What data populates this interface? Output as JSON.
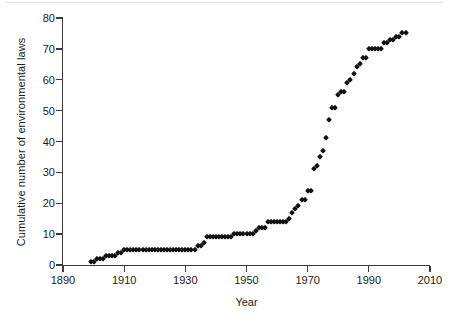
{
  "figure": {
    "background_color": "#ffffff",
    "marker_color": "#111111",
    "axis_color": "#3a3a3a"
  },
  "chart_data": {
    "type": "scatter",
    "title": "",
    "xlabel": "Year",
    "ylabel": "Cumulative number of environmental laws",
    "xlim": [
      1890,
      2010
    ],
    "ylim": [
      0,
      80
    ],
    "xticks": [
      1890,
      1910,
      1930,
      1950,
      1970,
      1990,
      2010
    ],
    "yticks": [
      0,
      10,
      20,
      30,
      40,
      50,
      60,
      70,
      80
    ],
    "grid": false,
    "legend": null,
    "marker": "diamond",
    "series": [
      {
        "name": "Cumulative environmental laws",
        "x": [
          1899,
          1900,
          1901,
          1902,
          1903,
          1904,
          1905,
          1906,
          1907,
          1908,
          1909,
          1910,
          1911,
          1912,
          1913,
          1914,
          1915,
          1916,
          1917,
          1918,
          1919,
          1920,
          1921,
          1922,
          1923,
          1924,
          1925,
          1926,
          1927,
          1928,
          1929,
          1930,
          1931,
          1932,
          1933,
          1934,
          1935,
          1936,
          1937,
          1938,
          1939,
          1940,
          1941,
          1942,
          1943,
          1944,
          1945,
          1946,
          1947,
          1948,
          1949,
          1950,
          1951,
          1952,
          1953,
          1954,
          1955,
          1956,
          1957,
          1958,
          1959,
          1960,
          1961,
          1962,
          1963,
          1964,
          1965,
          1966,
          1967,
          1968,
          1969,
          1970,
          1971,
          1972,
          1973,
          1974,
          1975,
          1976,
          1977,
          1978,
          1979,
          1980,
          1981,
          1982,
          1983,
          1984,
          1985,
          1986,
          1987,
          1988,
          1989,
          1990,
          1991,
          1992,
          1993,
          1994,
          1995,
          1996,
          1997,
          1998,
          1999,
          2000,
          2001,
          2002
        ],
        "y": [
          1,
          1,
          2,
          2,
          2,
          3,
          3,
          3,
          3,
          4,
          4,
          5,
          5,
          5,
          5,
          5,
          5,
          5,
          5,
          5,
          5,
          5,
          5,
          5,
          5,
          5,
          5,
          5,
          5,
          5,
          5,
          5,
          5,
          5,
          5,
          6,
          6,
          7,
          9,
          9,
          9,
          9,
          9,
          9,
          9,
          9,
          9,
          10,
          10,
          10,
          10,
          10,
          10,
          10,
          11,
          12,
          12,
          12,
          14,
          14,
          14,
          14,
          14,
          14,
          14,
          15,
          17,
          18,
          19,
          21,
          21,
          24,
          24,
          31,
          32,
          35,
          37,
          41,
          47,
          51,
          51,
          55,
          56,
          56,
          59,
          60,
          62,
          64,
          65,
          67,
          67,
          70,
          70,
          70,
          70,
          70,
          72,
          72,
          73,
          73,
          74,
          74,
          75,
          75
        ]
      }
    ]
  },
  "axis": {
    "x_tick_labels": [
      "1890",
      "1910",
      "1930",
      "1950",
      "1970",
      "1990",
      "2010"
    ],
    "y_tick_labels": [
      "0",
      "10",
      "20",
      "30",
      "40",
      "50",
      "60",
      "70",
      "80"
    ],
    "x_axis_title": "Year",
    "y_axis_title": "Cumulative number of environmental laws"
  }
}
